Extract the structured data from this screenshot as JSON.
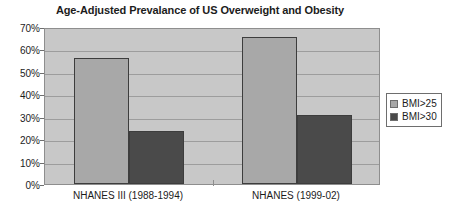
{
  "chart_data": {
    "type": "bar",
    "title": "Age-Adjusted Prevalance of US Overweight and Obesity",
    "xlabel": "",
    "ylabel": "",
    "categories": [
      "NHANES III (1988-1994)",
      "NHANES (1999-02)"
    ],
    "series": [
      {
        "name": "BMI>25",
        "values": [
          56,
          65.5
        ],
        "color": "#a8a8a8"
      },
      {
        "name": "BMI>30",
        "values": [
          23.5,
          30.8
        ],
        "color": "#4a4a4a"
      }
    ],
    "ylim": [
      0,
      70
    ],
    "ytick_step": 10,
    "ytick_labels": [
      "0%",
      "10%",
      "20%",
      "30%",
      "40%",
      "50%",
      "60%",
      "70%"
    ],
    "grid": true,
    "legend_position": "right",
    "plot_background": "#c8c8c8",
    "axis_color": "#8e8e8e"
  }
}
